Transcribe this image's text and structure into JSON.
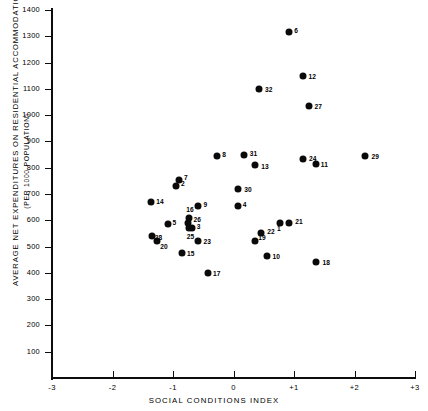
{
  "chart_data": {
    "type": "scatter",
    "title": "",
    "xlabel": "SOCIAL CONDITIONS INDEX",
    "ylabel": "AVERAGE NET EXPENDITURES ON RESIDENTIAL ACCOMMODATION 1965-68",
    "ylabel_line2": "(PER 1000 POPULATION)",
    "xlim": [
      -3,
      3
    ],
    "ylim": [
      0,
      1400
    ],
    "xticks": [
      -3,
      -2,
      -1,
      0,
      1,
      2,
      3
    ],
    "xticklabels": [
      "-3",
      "-2",
      "-1",
      "0",
      "+1",
      "+2",
      "+3"
    ],
    "yticks": [
      100,
      200,
      300,
      400,
      500,
      600,
      700,
      800,
      900,
      1000,
      1100,
      1200,
      1300,
      1400
    ],
    "yticklabels": [
      "100",
      "200",
      "300",
      "400",
      "500",
      "600",
      "700",
      "800",
      "900",
      "1000",
      "1100",
      "1200",
      "1300",
      "1400"
    ],
    "grid": false,
    "legend": false,
    "marker_color": "#0a0a0a",
    "points": [
      {
        "label": "1",
        "x": 0.77,
        "y": 590,
        "lx": -3,
        "ly": 5
      },
      {
        "label": "2",
        "x": -0.95,
        "y": 730,
        "lx": 5,
        "ly": -3
      },
      {
        "label": "3",
        "x": -0.69,
        "y": 570,
        "lx": 5,
        "ly": -2
      },
      {
        "label": "4",
        "x": 0.07,
        "y": 655,
        "lx": 5,
        "ly": -2
      },
      {
        "label": "5",
        "x": -1.09,
        "y": 585,
        "lx": 5,
        "ly": -2
      },
      {
        "label": "6",
        "x": 0.92,
        "y": 1315,
        "lx": 5,
        "ly": -2
      },
      {
        "label": "7",
        "x": -0.9,
        "y": 755,
        "lx": 5,
        "ly": -3
      },
      {
        "label": "8",
        "x": -0.27,
        "y": 845,
        "lx": 5,
        "ly": -2
      },
      {
        "label": "9",
        "x": -0.58,
        "y": 655,
        "lx": 5,
        "ly": -2
      },
      {
        "label": "10",
        "x": 0.56,
        "y": 465,
        "lx": 5,
        "ly": 0
      },
      {
        "label": "11",
        "x": 1.36,
        "y": 815,
        "lx": 5,
        "ly": 0
      },
      {
        "label": "12",
        "x": 1.14,
        "y": 1150,
        "lx": 6,
        "ly": 0
      },
      {
        "label": "13",
        "x": 0.36,
        "y": 810,
        "lx": 6,
        "ly": 1
      },
      {
        "label": "14",
        "x": -1.36,
        "y": 670,
        "lx": 5,
        "ly": -1
      },
      {
        "label": "15",
        "x": -0.85,
        "y": 475,
        "lx": 5,
        "ly": 0
      },
      {
        "label": "16",
        "x": -0.73,
        "y": 610,
        "lx": -3,
        "ly": -9
      },
      {
        "label": "17",
        "x": -0.42,
        "y": 400,
        "lx": 5,
        "ly": 0
      },
      {
        "label": "18",
        "x": 1.37,
        "y": 440,
        "lx": 6,
        "ly": 0
      },
      {
        "label": "19",
        "x": 0.36,
        "y": 520,
        "lx": 3,
        "ly": -4
      },
      {
        "label": "20",
        "x": -1.26,
        "y": 520,
        "lx": 3,
        "ly": 5
      },
      {
        "label": "21",
        "x": 0.92,
        "y": 590,
        "lx": 6,
        "ly": -2
      },
      {
        "label": "22",
        "x": 0.46,
        "y": 550,
        "lx": 6,
        "ly": -2
      },
      {
        "label": "23",
        "x": -0.58,
        "y": 520,
        "lx": 5,
        "ly": 0
      },
      {
        "label": "24",
        "x": 1.15,
        "y": 835,
        "lx": 6,
        "ly": -1
      },
      {
        "label": "25",
        "x": -0.74,
        "y": 570,
        "lx": -2,
        "ly": 8
      },
      {
        "label": "26",
        "x": -0.76,
        "y": 590,
        "lx": 6,
        "ly": -4
      },
      {
        "label": "27",
        "x": 1.24,
        "y": 1035,
        "lx": 6,
        "ly": 0
      },
      {
        "label": "28",
        "x": -1.35,
        "y": 540,
        "lx": 3,
        "ly": 1
      },
      {
        "label": "29",
        "x": 2.18,
        "y": 845,
        "lx": 6,
        "ly": 0
      },
      {
        "label": "30",
        "x": 0.08,
        "y": 720,
        "lx": 6,
        "ly": 0
      },
      {
        "label": "31",
        "x": 0.17,
        "y": 848,
        "lx": 6,
        "ly": -2
      },
      {
        "label": "32",
        "x": 0.42,
        "y": 1100,
        "lx": 6,
        "ly": 0
      }
    ]
  }
}
